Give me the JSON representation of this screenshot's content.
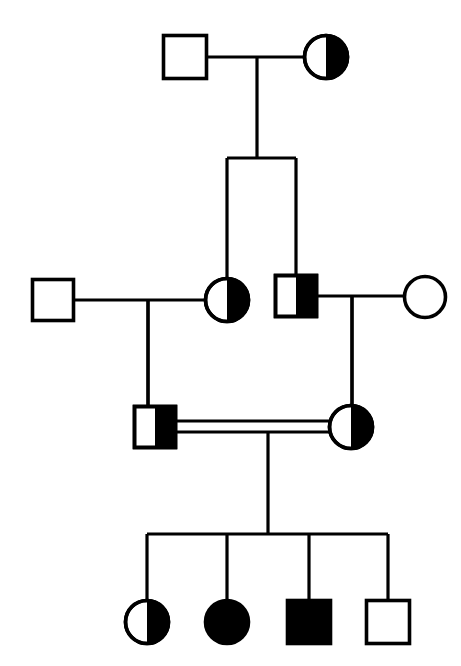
{
  "diagram": {
    "kind": "pedigree-chart",
    "title": "",
    "width": 461,
    "height": 666,
    "background_color": "#ffffff",
    "stroke_color": "#000000",
    "fill_affected_color": "#000000",
    "fill_unaffected_color": "#ffffff",
    "line_width": 3.2,
    "symbol_line_width": 3.6,
    "legend": {
      "square_meaning": "male",
      "circle_meaning": "female",
      "open_meaning": "unaffected",
      "filled_meaning": "affected",
      "half_filled_meaning": "carrier (heterozygote)",
      "double_line_meaning": "consanguineous mating"
    },
    "generations": [
      {
        "id": "I",
        "label": "",
        "y": 57,
        "individuals": [
          {
            "id": "I-1",
            "shape": "square",
            "sex": "male",
            "status": "unaffected",
            "fill": "open",
            "cx": 185,
            "cy": 57,
            "size": 43
          },
          {
            "id": "I-2",
            "shape": "circle",
            "sex": "female",
            "status": "carrier",
            "fill": "half-right",
            "cx": 326,
            "cy": 57,
            "size": 43
          }
        ]
      },
      {
        "id": "II",
        "label": "",
        "y": 300,
        "individuals": [
          {
            "id": "II-1",
            "shape": "square",
            "sex": "male",
            "status": "unaffected",
            "fill": "open",
            "cx": 53,
            "cy": 300,
            "size": 41
          },
          {
            "id": "II-2",
            "shape": "circle",
            "sex": "female",
            "status": "carrier",
            "fill": "half-right",
            "cx": 227,
            "cy": 300,
            "size": 43
          },
          {
            "id": "II-3",
            "shape": "square",
            "sex": "male",
            "status": "carrier",
            "fill": "half-right",
            "cx": 296,
            "cy": 296,
            "size": 41
          },
          {
            "id": "II-4",
            "shape": "circle",
            "sex": "female",
            "status": "unaffected",
            "fill": "open",
            "cx": 425,
            "cy": 297,
            "size": 41
          }
        ]
      },
      {
        "id": "III",
        "label": "",
        "y": 427,
        "individuals": [
          {
            "id": "III-1",
            "shape": "square",
            "sex": "male",
            "status": "carrier",
            "fill": "half-right",
            "cx": 155,
            "cy": 427,
            "size": 41
          },
          {
            "id": "III-2",
            "shape": "circle",
            "sex": "female",
            "status": "carrier",
            "fill": "half-right",
            "cx": 351,
            "cy": 427,
            "size": 43
          }
        ]
      },
      {
        "id": "IV",
        "label": "",
        "y": 622,
        "individuals": [
          {
            "id": "IV-1",
            "shape": "circle",
            "sex": "female",
            "status": "carrier",
            "fill": "half-right",
            "cx": 147,
            "cy": 622,
            "size": 43
          },
          {
            "id": "IV-2",
            "shape": "circle",
            "sex": "female",
            "status": "affected",
            "fill": "full",
            "cx": 227,
            "cy": 622,
            "size": 43
          },
          {
            "id": "IV-3",
            "shape": "square",
            "sex": "male",
            "status": "affected",
            "fill": "full",
            "cx": 309,
            "cy": 622,
            "size": 43
          },
          {
            "id": "IV-4",
            "shape": "square",
            "sex": "male",
            "status": "unaffected",
            "fill": "open",
            "cx": 388,
            "cy": 622,
            "size": 43
          }
        ]
      }
    ],
    "matings": [
      {
        "id": "mating-I",
        "type": "single",
        "partners": [
          "I-1",
          "I-2"
        ],
        "x1": 207,
        "x2": 305,
        "y": 57,
        "drop_x": 257,
        "drop_y1": 57,
        "drop_y2": 158
      },
      {
        "id": "mating-II-left",
        "type": "single",
        "partners": [
          "II-1",
          "II-2"
        ],
        "x1": 74,
        "x2": 206,
        "y": 300,
        "drop_x": 148,
        "drop_y1": 300,
        "drop_y2": 427
      },
      {
        "id": "mating-II-right",
        "type": "single",
        "partners": [
          "II-3",
          "II-4"
        ],
        "x1": 317,
        "x2": 405,
        "y": 296,
        "drop_x": 352,
        "drop_y1": 296,
        "drop_y2": 427
      },
      {
        "id": "mating-III-consanguineous",
        "type": "double",
        "partners": [
          "III-1",
          "III-2"
        ],
        "x1": 176,
        "x2": 330,
        "y_top": 421,
        "y_bottom": 432,
        "drop_x": 268,
        "drop_y1": 432,
        "drop_y2": 534
      }
    ],
    "sibships": [
      {
        "id": "sibship-II",
        "parent_mating": "mating-I",
        "bar_y": 158,
        "bar_x1": 227,
        "bar_x2": 296,
        "children": [
          {
            "id": "II-2",
            "drop_x": 227,
            "drop_y2": 279
          },
          {
            "id": "II-3",
            "drop_x": 296,
            "drop_y2": 276
          }
        ]
      },
      {
        "id": "sibship-IV",
        "parent_mating": "mating-III-consanguineous",
        "bar_y": 534,
        "bar_x1": 147,
        "bar_x2": 388,
        "children": [
          {
            "id": "IV-1",
            "drop_x": 147,
            "drop_y2": 601
          },
          {
            "id": "IV-2",
            "drop_x": 227,
            "drop_y2": 601
          },
          {
            "id": "IV-3",
            "drop_x": 309,
            "drop_y2": 601
          },
          {
            "id": "IV-4",
            "drop_x": 388,
            "drop_y2": 601
          }
        ]
      }
    ],
    "descent_lines": [
      {
        "id": "descent-III-1",
        "from_mating": "mating-II-left",
        "to_individual": "III-1",
        "x": 148,
        "y1": 300,
        "y2": 407
      },
      {
        "id": "descent-III-2",
        "from_mating": "mating-II-right",
        "to_individual": "III-2",
        "x": 352,
        "y1": 296,
        "y2": 406
      }
    ]
  }
}
